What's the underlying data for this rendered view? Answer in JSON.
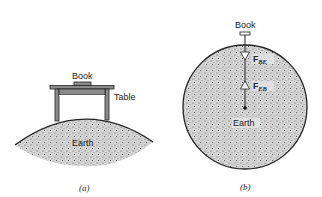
{
  "panel_a": {
    "labels": {
      "book": "Book",
      "table": "Table",
      "earth": "Earth"
    },
    "caption": "(a)"
  },
  "panel_b": {
    "labels": {
      "book": "Book",
      "earth": "Earth"
    },
    "forces": [
      {
        "symbol": "F",
        "subscript": "BE",
        "direction": "down"
      },
      {
        "symbol": "F",
        "subscript": "EB",
        "direction": "up"
      }
    ],
    "caption": "(b)"
  },
  "colors": {
    "stroke": "#222222",
    "table_fill": "#8a8a8a",
    "earth_fill": "#c8c8c8"
  }
}
